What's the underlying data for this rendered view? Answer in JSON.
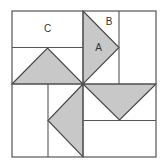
{
  "diagram": {
    "colors": {
      "background": "#ffffff",
      "lines": "#555555",
      "shaded": "#c8c8c8"
    },
    "labels": {
      "c": "C",
      "b": "B",
      "a": "A"
    },
    "shaded_triangles": [
      {
        "id": "top-left",
        "quadrant": "top-left"
      },
      {
        "id": "top-right",
        "quadrant": "top-right",
        "label": "A"
      },
      {
        "id": "bottom-right",
        "quadrant": "bottom-right"
      },
      {
        "id": "bottom-left",
        "quadrant": "bottom-left"
      }
    ]
  }
}
